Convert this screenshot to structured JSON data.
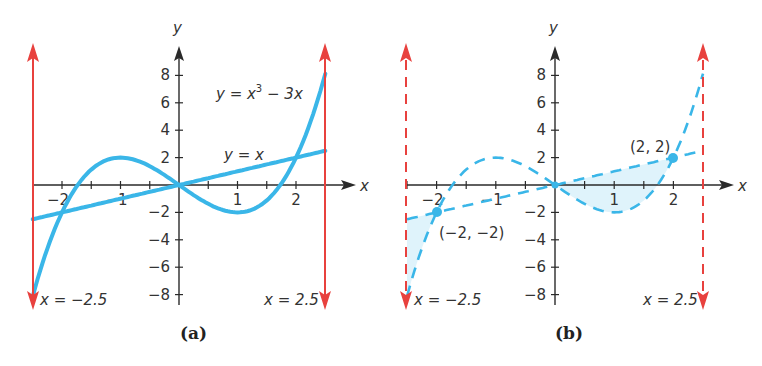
{
  "chart_data": [
    {
      "type": "line",
      "panel": "a",
      "caption": "(a)",
      "title": "",
      "xlabel": "x",
      "ylabel": "y",
      "xlim": [
        -2.5,
        2.5
      ],
      "ylim": [
        -8,
        8
      ],
      "grid": false,
      "x_ticks": [
        -2,
        -1.5,
        -1,
        -0.5,
        0,
        0.5,
        1,
        1.5,
        2,
        2.5
      ],
      "x_tick_labels": [
        {
          "value": -2,
          "label": "−2"
        },
        {
          "value": -1,
          "label": "−1"
        },
        {
          "value": 1,
          "label": "1"
        },
        {
          "value": 2,
          "label": "2"
        }
      ],
      "y_ticks": [
        -8,
        -6,
        -4,
        -2,
        2,
        4,
        6,
        8
      ],
      "y_tick_labels": [
        {
          "value": 8,
          "label": "8"
        },
        {
          "value": 6,
          "label": "6"
        },
        {
          "value": 4,
          "label": "4"
        },
        {
          "value": 2,
          "label": "2"
        },
        {
          "value": -2,
          "label": "−2"
        },
        {
          "value": -4,
          "label": "−4"
        },
        {
          "value": -6,
          "label": "−6"
        },
        {
          "value": -8,
          "label": "−8"
        }
      ],
      "series": [
        {
          "name": "y = x³ − 3x",
          "expr": "cubic",
          "style": "solid",
          "color": "#3ab6e8",
          "x": [
            -2.5,
            -2,
            -1.5,
            -1,
            -0.5,
            0,
            0.5,
            1,
            1.5,
            2,
            2.5
          ],
          "y": [
            -8.125,
            -2,
            1.125,
            2,
            1.375,
            0,
            -1.375,
            -2,
            -1.125,
            2,
            8.125
          ]
        },
        {
          "name": "y = x",
          "expr": "linear",
          "style": "solid",
          "color": "#3ab6e8",
          "x": [
            -2.5,
            2.5
          ],
          "y": [
            -2.5,
            2.5
          ]
        }
      ],
      "vertical_lines": [
        {
          "x": -2.5,
          "label": "x = −2.5",
          "style": "solid",
          "color": "#e8413e"
        },
        {
          "x": 2.5,
          "label": "x = 2.5",
          "style": "solid",
          "color": "#e8413e"
        }
      ],
      "annotations": [
        {
          "text_main": "y = x",
          "text_sup": "3",
          "text_rest": " − 3x",
          "for": "cubic"
        },
        {
          "text": "y = x",
          "for": "linear"
        }
      ]
    },
    {
      "type": "line",
      "panel": "b",
      "caption": "(b)",
      "title": "",
      "xlabel": "x",
      "ylabel": "y",
      "xlim": [
        -2.5,
        2.5
      ],
      "ylim": [
        -8,
        8
      ],
      "grid": false,
      "x_ticks": [
        -2.5,
        -2,
        -1.5,
        -1,
        -0.5,
        0,
        0.5,
        1,
        1.5,
        2,
        2.5
      ],
      "x_tick_labels": [
        {
          "value": -2,
          "label": "−2"
        },
        {
          "value": -1,
          "label": "−1"
        },
        {
          "value": 1,
          "label": "1"
        },
        {
          "value": 2,
          "label": "2"
        }
      ],
      "y_ticks": [
        -8,
        -6,
        -4,
        -2,
        2,
        4,
        6,
        8
      ],
      "y_tick_labels": [
        {
          "value": 8,
          "label": "8"
        },
        {
          "value": 6,
          "label": "6"
        },
        {
          "value": 4,
          "label": "4"
        },
        {
          "value": 2,
          "label": "2"
        },
        {
          "value": -2,
          "label": "−2"
        },
        {
          "value": -4,
          "label": "−4"
        },
        {
          "value": -6,
          "label": "−6"
        },
        {
          "value": -8,
          "label": "−8"
        }
      ],
      "series": [
        {
          "name": "y = x³ − 3x",
          "expr": "cubic",
          "style": "dashed",
          "color": "#3ab6e8",
          "x": [
            -2.5,
            -2,
            -1.5,
            -1,
            -0.5,
            0,
            0.5,
            1,
            1.5,
            2,
            2.5
          ],
          "y": [
            -8.125,
            -2,
            1.125,
            2,
            1.375,
            0,
            -1.375,
            -2,
            -1.125,
            2,
            8.125
          ]
        },
        {
          "name": "y = x",
          "expr": "linear",
          "style": "dashed",
          "color": "#3ab6e8",
          "x": [
            -2.5,
            2.5
          ],
          "y": [
            -2.5,
            2.5
          ]
        }
      ],
      "shaded_regions": [
        {
          "from_x": -2.5,
          "to_x": -2,
          "between": [
            "cubic",
            "linear"
          ],
          "color": "#dff3fb"
        },
        {
          "from_x": 0,
          "to_x": 2,
          "between": [
            "cubic",
            "linear"
          ],
          "color": "#dff3fb"
        }
      ],
      "vertical_lines": [
        {
          "x": -2.5,
          "label": "x = −2.5",
          "style": "dashed",
          "color": "#e8413e"
        },
        {
          "x": 2.5,
          "label": "x = 2.5",
          "style": "dashed",
          "color": "#e8413e"
        }
      ],
      "points": [
        {
          "x": -2,
          "y": -2,
          "label": "(−2, −2)"
        },
        {
          "x": 0,
          "y": 0,
          "label": ""
        },
        {
          "x": 2,
          "y": 2,
          "label": "(2, 2)"
        }
      ]
    }
  ],
  "panels": {
    "a": {
      "caption": "(a)",
      "x_axis_name": "x",
      "y_axis_name": "y",
      "cubic_label_main": "y = x",
      "cubic_label_sup": "3",
      "cubic_label_rest": " − 3x",
      "linear_label": "y = x",
      "left_line_label": "x = −2.5",
      "right_line_label": "x = 2.5"
    },
    "b": {
      "caption": "(b)",
      "x_axis_name": "x",
      "y_axis_name": "y",
      "left_line_label": "x = −2.5",
      "right_line_label": "x = 2.5",
      "point_left_label": "(−2, −2)",
      "point_right_label": "(2, 2)"
    }
  },
  "colors": {
    "curve": "#3ab6e8",
    "boundary": "#e8413e",
    "axis": "#2a2a2a",
    "shade": "#dff3fb"
  }
}
